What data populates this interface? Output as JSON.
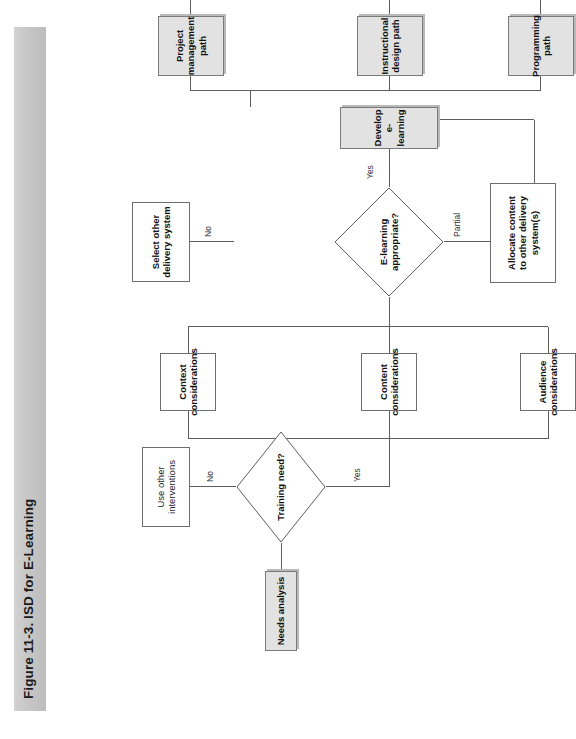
{
  "figure": {
    "title": "Figure 11-3. ISD for E-Learning",
    "orientation": "rotated-90-ccw",
    "band_color": "#c6c6c6"
  },
  "nodes": {
    "needs_analysis": {
      "label": "Needs analysis",
      "shape": "box",
      "style": "shaded"
    },
    "training_need": {
      "label": "Training need?",
      "shape": "diamond",
      "style": "white"
    },
    "use_other_interventions": {
      "label": "Use other\ninterventions",
      "shape": "box",
      "style": "white"
    },
    "context_considerations": {
      "label": "Context\nconsiderations",
      "shape": "box",
      "style": "white"
    },
    "content_considerations": {
      "label": "Content\nconsiderations",
      "shape": "box",
      "style": "white"
    },
    "audience_considerations": {
      "label": "Audience\nconsiderations",
      "shape": "box",
      "style": "white"
    },
    "elearning_appropriate": {
      "label": "E-learning\nappropriate?",
      "shape": "diamond",
      "style": "white"
    },
    "select_other_delivery": {
      "label": "Select other\ndelivery system",
      "shape": "box",
      "style": "white"
    },
    "allocate_content": {
      "label": "Allocate content\nto other delivery\nsystem(s)",
      "shape": "box",
      "style": "white"
    },
    "develop_elearning": {
      "label": "Develop\ne-learning",
      "shape": "box",
      "style": "shaded"
    },
    "project_management_path": {
      "label": "Project\nmanagement\npath",
      "shape": "box",
      "style": "shaded"
    },
    "instructional_design_path": {
      "label": "Instructional\ndesign path",
      "shape": "box",
      "style": "shaded"
    },
    "programming_path": {
      "label": "Programming\npath",
      "shape": "box",
      "style": "shaded"
    }
  },
  "edge_labels": {
    "training_need_no": "No",
    "training_need_yes": "Yes",
    "elearning_no": "No",
    "elearning_partial": "Partial",
    "elearning_yes": "Yes"
  },
  "colors": {
    "line": "#5d5d5d",
    "shaded_fill": "#e2e2e2",
    "box_border": "#6e6e6e",
    "text": "#111111"
  }
}
